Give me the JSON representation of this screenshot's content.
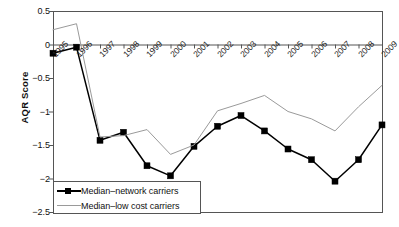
{
  "chart_data": {
    "type": "line",
    "title": "",
    "subtitle": "",
    "xlabel": "",
    "ylabel": "AQR Score",
    "x": [
      1995,
      1996,
      1997,
      1998,
      1999,
      2000,
      2001,
      2002,
      2003,
      2004,
      2005,
      2006,
      2007,
      2008,
      2009
    ],
    "categories": [
      "1995",
      "1996",
      "1997",
      "1998",
      "1999",
      "2000",
      "2001",
      "2002",
      "2003",
      "2004",
      "2005",
      "2006",
      "2007",
      "2008",
      "2009"
    ],
    "series": [
      {
        "name": "Median–network carriers",
        "color": "#000000",
        "marker": "square",
        "values": [
          -0.13,
          -0.04,
          -1.43,
          -1.31,
          -1.81,
          -1.96,
          -1.52,
          -1.22,
          -1.06,
          -1.29,
          -1.56,
          -1.72,
          -2.04,
          -1.72,
          -1.2
        ]
      },
      {
        "name": "Median–low cost carriers",
        "color": "#9a9a9a",
        "marker": "none",
        "values": [
          0.22,
          0.31,
          -1.38,
          -1.36,
          -1.27,
          -1.64,
          -1.5,
          -0.99,
          -0.88,
          -0.76,
          -1.0,
          -1.11,
          -1.29,
          -0.93,
          -0.61
        ]
      }
    ],
    "ylim": [
      -2.5,
      0.5
    ],
    "xlim": [
      1995,
      2009
    ],
    "yticks": [
      0.5,
      0,
      -0.5,
      -1,
      -1.5,
      -2,
      -2.5
    ],
    "ytick_labels": [
      "0.5",
      "0",
      "−0.5",
      "−1",
      "−1.5",
      "−2",
      "−2.5"
    ],
    "grid": false,
    "zero_line": true,
    "legend_position": "bottom-left-inside",
    "xtick_label_rotation": -45
  },
  "legend": {
    "items": [
      {
        "label": "Median–network carriers",
        "key": "network"
      },
      {
        "label": "Median–low cost carriers",
        "key": "lowcost"
      }
    ]
  },
  "colors": {
    "network": "#000000",
    "lowcost": "#9a9a9a",
    "axis": "#555555",
    "text": "#111111",
    "background": "#ffffff"
  }
}
